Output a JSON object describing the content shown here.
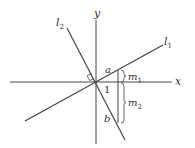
{
  "diagram": {
    "title": "",
    "colors": {
      "line": "#444444",
      "text": "#333333",
      "background": "#ffffff"
    },
    "axes": {
      "x_label": "x",
      "y_label": "y"
    },
    "lines": [
      {
        "id": "l1",
        "label": "l",
        "subscript": "1"
      },
      {
        "id": "l2",
        "label": "l",
        "subscript": "2"
      }
    ],
    "points": {
      "a": "a",
      "b": "b",
      "unit": "1"
    },
    "braces": [
      {
        "label": "m",
        "subscript": "1"
      },
      {
        "label": "m",
        "subscript": "2"
      }
    ],
    "markers": {
      "right_angle": "right-angle between l1 and l2 at origin"
    }
  }
}
